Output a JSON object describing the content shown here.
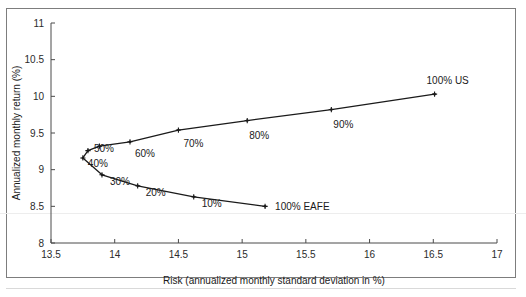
{
  "figure": {
    "background_color": "#ffffff",
    "border_color": "#7d7d7d"
  },
  "chart_data": {
    "type": "line",
    "title": "",
    "xlabel": "Risk (annualized monthly standard deviation in %)",
    "ylabel": "Annualized monthly return (%)",
    "xlim": [
      13.5,
      17.0
    ],
    "ylim": [
      8.0,
      11.0
    ],
    "xticks": [
      13.5,
      14,
      14.5,
      15,
      15.5,
      16,
      16.5,
      17
    ],
    "xticklabels": [
      "13.5",
      "14",
      "14.5",
      "15",
      "15.5",
      "16",
      "16.5",
      "17"
    ],
    "yticks": [
      8,
      8.5,
      9,
      9.5,
      10,
      10.5,
      11
    ],
    "yticklabels": [
      "8",
      "8.5",
      "9",
      "9.5",
      "10",
      "10.5",
      "11"
    ],
    "grid": false,
    "legend": null,
    "series": [
      {
        "name": "Efficient frontier (US / EAFE allocation)",
        "x": [
          15.18,
          14.62,
          14.18,
          13.9,
          13.75,
          13.79,
          13.88,
          14.12,
          14.5,
          15.04,
          15.7,
          16.51
        ],
        "y": [
          8.5,
          8.63,
          8.78,
          8.93,
          9.16,
          9.26,
          9.32,
          9.38,
          9.54,
          9.67,
          9.82,
          10.03
        ],
        "labels": [
          "100% EAFE",
          "10%",
          "20%",
          "30%",
          "40%",
          "50%",
          "",
          "60%",
          "70%",
          "80%",
          "90%",
          "100% US"
        ]
      }
    ],
    "annotations": [
      {
        "text": "100% EAFE",
        "x": 15.18,
        "y": 8.5,
        "dx": 10,
        "dy": 4
      },
      {
        "text": "10%",
        "x": 14.62,
        "y": 8.63,
        "dx": 8,
        "dy": 10
      },
      {
        "text": "20%",
        "x": 14.18,
        "y": 8.78,
        "dx": 8,
        "dy": 10
      },
      {
        "text": "30%",
        "x": 13.9,
        "y": 8.93,
        "dx": 8,
        "dy": 10
      },
      {
        "text": "40%",
        "x": 13.75,
        "y": 9.16,
        "dx": 5,
        "dy": 9
      },
      {
        "text": "50%",
        "x": 13.79,
        "y": 9.26,
        "dx": 6,
        "dy": 1
      },
      {
        "text": "60%",
        "x": 14.12,
        "y": 9.38,
        "dx": 5,
        "dy": 15
      },
      {
        "text": "70%",
        "x": 14.5,
        "y": 9.54,
        "dx": 5,
        "dy": 17
      },
      {
        "text": "80%",
        "x": 15.04,
        "y": 9.67,
        "dx": 2,
        "dy": 18
      },
      {
        "text": "90%",
        "x": 15.7,
        "y": 9.82,
        "dx": 2,
        "dy": 18
      },
      {
        "text": "100% US",
        "x": 16.51,
        "y": 10.03,
        "dx": -8,
        "dy": -10
      }
    ]
  }
}
